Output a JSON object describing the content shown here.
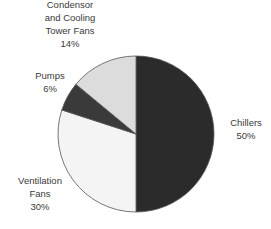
{
  "chart_data": {
    "type": "pie",
    "title": "",
    "start_angle": "12 o'clock",
    "direction": "clockwise",
    "slices": [
      {
        "label": "Chillers",
        "value": 50,
        "display": "50%",
        "color": "#2b2b2b"
      },
      {
        "label": "Ventilation Fans",
        "value": 30,
        "display": "30%",
        "color": "#f4f4f4"
      },
      {
        "label": "Pumps",
        "value": 6,
        "display": "6%",
        "color": "#3a3a3a"
      },
      {
        "label": "Condensor and Cooling Tower Fans",
        "value": 14,
        "display": "14%",
        "color": "#dcdcdc"
      }
    ],
    "labels": [
      {
        "lines": [
          "Chillers",
          "50%"
        ]
      },
      {
        "lines": [
          "Ventilation",
          "Fans",
          "30%"
        ]
      },
      {
        "lines": [
          "Pumps",
          "6%"
        ]
      },
      {
        "lines": [
          "Condensor",
          "and Cooling",
          "Tower Fans",
          "14%"
        ]
      }
    ]
  }
}
